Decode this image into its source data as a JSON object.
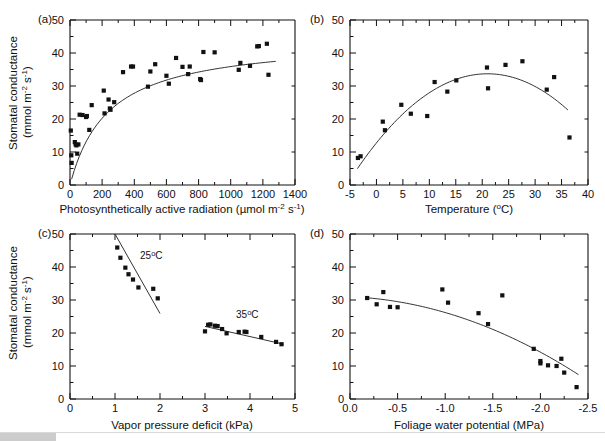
{
  "figure": {
    "background": "#ffffff",
    "marker_color": "#111111",
    "line_color": "#333333",
    "panel_count": 4
  },
  "chart_data": [
    {
      "type": "scatter",
      "panel": "(a)",
      "title": "",
      "xlabel": "Photosynthetically active radiation (µmol m⁻² s⁻¹)",
      "ylabel": "Stomatal conductance (mmol m⁻² s⁻¹)",
      "xlim": [
        0,
        1400
      ],
      "ylim": [
        0,
        50
      ],
      "xticks": [
        0,
        200,
        400,
        600,
        800,
        1000,
        1200,
        1400
      ],
      "yticks": [
        0,
        10,
        20,
        30,
        40,
        50
      ],
      "minor_ticks": true,
      "grid": false,
      "legend": "none",
      "points": [
        [
          5,
          16.5
        ],
        [
          8,
          9.0
        ],
        [
          10,
          6.7
        ],
        [
          30,
          13.0
        ],
        [
          35,
          12.3
        ],
        [
          40,
          12.0
        ],
        [
          45,
          9.5
        ],
        [
          52,
          12.3
        ],
        [
          60,
          21.3
        ],
        [
          78,
          21.2
        ],
        [
          100,
          20.6
        ],
        [
          105,
          20.9
        ],
        [
          120,
          16.7
        ],
        [
          135,
          24.2
        ],
        [
          210,
          28.6
        ],
        [
          215,
          21.7
        ],
        [
          240,
          25.9
        ],
        [
          248,
          23.2
        ],
        [
          252,
          22.8
        ],
        [
          275,
          25.1
        ],
        [
          330,
          34.2
        ],
        [
          380,
          35.9
        ],
        [
          392,
          35.9
        ],
        [
          485,
          29.8
        ],
        [
          500,
          34.4
        ],
        [
          530,
          36.6
        ],
        [
          600,
          33.1
        ],
        [
          615,
          30.7
        ],
        [
          660,
          38.5
        ],
        [
          700,
          35.8
        ],
        [
          735,
          33.6
        ],
        [
          745,
          35.9
        ],
        [
          810,
          32.1
        ],
        [
          815,
          31.8
        ],
        [
          830,
          40.3
        ],
        [
          900,
          40.2
        ],
        [
          1050,
          34.9
        ],
        [
          1060,
          37.0
        ],
        [
          1120,
          36.1
        ],
        [
          1165,
          42.0
        ],
        [
          1175,
          42.1
        ],
        [
          1225,
          42.8
        ],
        [
          1235,
          33.4
        ]
      ],
      "fit": {
        "kind": "saturating",
        "description": "rectangular hyperbola rising to plateau near 39"
      }
    },
    {
      "type": "scatter",
      "panel": "(b)",
      "title": "",
      "xlabel": "Temperature (°C)",
      "ylabel": "Stomatal conductance (mmol m⁻² s⁻¹)",
      "xlim": [
        -5,
        40
      ],
      "ylim": [
        0,
        50
      ],
      "xticks": [
        -5,
        0,
        5,
        10,
        15,
        20,
        25,
        30,
        35,
        40
      ],
      "yticks": [
        0,
        10,
        20,
        30,
        40,
        50
      ],
      "minor_ticks": true,
      "grid": false,
      "legend": "none",
      "points": [
        [
          -3.5,
          8.2
        ],
        [
          -3.0,
          8.7
        ],
        [
          1.2,
          19.2
        ],
        [
          1.6,
          16.6
        ],
        [
          4.7,
          24.3
        ],
        [
          6.5,
          21.6
        ],
        [
          9.6,
          20.9
        ],
        [
          11.0,
          31.2
        ],
        [
          13.4,
          28.3
        ],
        [
          15.1,
          31.7
        ],
        [
          20.9,
          35.6
        ],
        [
          21.1,
          29.3
        ],
        [
          24.4,
          36.4
        ],
        [
          27.6,
          37.5
        ],
        [
          32.2,
          28.9
        ],
        [
          33.6,
          32.7
        ],
        [
          36.5,
          14.4
        ]
      ],
      "fit": {
        "kind": "quadratic",
        "description": "inverted parabola peaking near 21 °C at about 33.7"
      }
    },
    {
      "type": "scatter",
      "panel": "(c)",
      "title": "",
      "xlabel": "Vapor pressure deficit (kPa)",
      "ylabel": "Stomatal conductance (mmol m⁻² s⁻¹)",
      "xlim": [
        0,
        5
      ],
      "ylim": [
        0,
        50
      ],
      "xticks": [
        0,
        1,
        2,
        3,
        4,
        5
      ],
      "yticks": [
        0,
        10,
        20,
        30,
        40,
        50
      ],
      "minor_ticks": true,
      "grid": false,
      "legend": "inline-annotations",
      "annotations": [
        {
          "text": "25°C",
          "x": 1.55,
          "y": 42.5
        },
        {
          "text": "35°C",
          "x": 3.75,
          "y": 24.8
        }
      ],
      "series": [
        {
          "name": "25°C",
          "points": [
            [
              1.05,
              45.9
            ],
            [
              1.12,
              42.8
            ],
            [
              1.23,
              39.8
            ],
            [
              1.3,
              37.8
            ],
            [
              1.4,
              36.2
            ],
            [
              1.52,
              33.8
            ],
            [
              1.85,
              33.4
            ],
            [
              1.95,
              30.5
            ]
          ],
          "fit": {
            "kind": "linear",
            "x_range": [
              1.0,
              2.0
            ],
            "y_range": [
              50.0,
              25.9
            ]
          }
        },
        {
          "name": "35°C",
          "points": [
            [
              3.0,
              20.5
            ],
            [
              3.07,
              22.5
            ],
            [
              3.12,
              22.6
            ],
            [
              3.22,
              22.2
            ],
            [
              3.28,
              22.1
            ],
            [
              3.38,
              21.2
            ],
            [
              3.48,
              19.9
            ],
            [
              3.75,
              20.3
            ],
            [
              3.88,
              20.4
            ],
            [
              3.92,
              20.3
            ],
            [
              4.25,
              18.8
            ],
            [
              4.58,
              17.3
            ],
            [
              4.7,
              16.6
            ]
          ],
          "fit": {
            "kind": "linear",
            "x_range": [
              3.0,
              4.75
            ],
            "y_range": [
              22.0,
              16.6
            ]
          }
        }
      ]
    },
    {
      "type": "scatter",
      "panel": "(d)",
      "title": "",
      "xlabel": "Foliage water potential (MPa)",
      "ylabel": "Stomatal conductance (mmol m⁻² s⁻¹)",
      "xlim": [
        0.0,
        -2.5
      ],
      "ylim": [
        0,
        50
      ],
      "xticks": [
        0.0,
        -0.5,
        -1.0,
        -1.5,
        -2.0,
        -2.5
      ],
      "yticks": [
        0,
        10,
        20,
        30,
        40,
        50
      ],
      "x_axis_reversed": true,
      "minor_ticks": true,
      "grid": false,
      "legend": "none",
      "points": [
        [
          -0.18,
          30.6
        ],
        [
          -0.28,
          28.7
        ],
        [
          -0.35,
          32.4
        ],
        [
          -0.42,
          27.9
        ],
        [
          -0.5,
          27.8
        ],
        [
          -0.97,
          33.2
        ],
        [
          -1.03,
          29.2
        ],
        [
          -1.35,
          26.0
        ],
        [
          -1.45,
          22.7
        ],
        [
          -1.6,
          31.4
        ],
        [
          -1.93,
          15.2
        ],
        [
          -2.0,
          11.5
        ],
        [
          -2.0,
          10.8
        ],
        [
          -2.08,
          10.2
        ],
        [
          -2.17,
          10.0
        ],
        [
          -2.22,
          12.2
        ],
        [
          -2.25,
          8.0
        ],
        [
          -2.38,
          3.6
        ]
      ],
      "fit": {
        "kind": "quadratic-decline",
        "description": "gently declining then steepening curve from about 30.5 to 3.6"
      }
    }
  ],
  "labels": {
    "panel_a": "(a)",
    "panel_b": "(b)",
    "panel_c": "(c)",
    "panel_d": "(d)",
    "y_axis_line1": "Stomatal conductance",
    "y_axis_line2_prefix": "(mmol m",
    "y_axis_sup1": "-2",
    "y_axis_mid": " s",
    "y_axis_sup2": "-1",
    "y_axis_suffix": ")",
    "x_a_prefix": "Photosynthetically active radiation (µmol m",
    "x_a_sup1": "-2",
    "x_a_mid": " s",
    "x_a_sup2": "-1",
    "x_a_suffix": ")",
    "x_b_prefix": "Temperature (",
    "x_b_deg": "o",
    "x_b_suffix": "C)",
    "x_c": "Vapor pressure deficit (kPa)",
    "x_d": "Foliage water potential (MPa)",
    "annot_25": "25",
    "annot_25_deg": "o",
    "annot_25_unit": "C",
    "annot_35": "35",
    "annot_35_deg": "o",
    "annot_35_unit": "C",
    "ticks_a_x": [
      "0",
      "200",
      "400",
      "600",
      "800",
      "1000",
      "1200",
      "1400"
    ],
    "ticks_b_x": [
      "-5",
      "0",
      "5",
      "10",
      "15",
      "20",
      "25",
      "30",
      "35",
      "40"
    ],
    "ticks_c_x": [
      "0",
      "1",
      "2",
      "3",
      "4",
      "5"
    ],
    "ticks_d_x": [
      "0.0",
      "-0.5",
      "-1.0",
      "-1.5",
      "-2.0",
      "-2.5"
    ],
    "ticks_y": [
      "0",
      "10",
      "20",
      "30",
      "40",
      "50"
    ]
  }
}
